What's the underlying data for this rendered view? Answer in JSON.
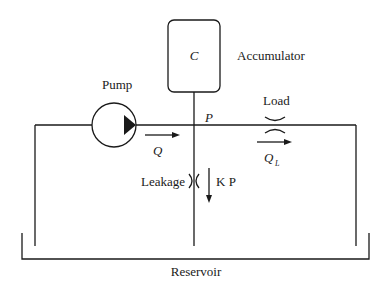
{
  "diagram": {
    "type": "hydraulic-circuit",
    "colors": {
      "line": "#1a1a1a",
      "background": "#ffffff"
    },
    "labels": {
      "accumulator": "Accumulator",
      "accumulator_symbol": "C",
      "pump": "Pump",
      "pressure": "P",
      "pump_flow": "Q",
      "load": "Load",
      "load_flow": "Q",
      "load_flow_sub": "L",
      "leakage": "Leakage",
      "leakage_flow": "K P",
      "reservoir": "Reservoir"
    },
    "components": [
      {
        "name": "accumulator",
        "symbol": "C"
      },
      {
        "name": "pump"
      },
      {
        "name": "load-orifice"
      },
      {
        "name": "leakage-orifice"
      },
      {
        "name": "reservoir"
      }
    ]
  }
}
